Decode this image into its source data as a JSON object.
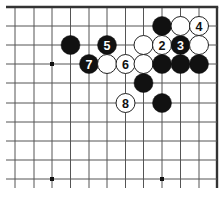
{
  "diagram": {
    "type": "go-board",
    "corner": "top-right",
    "grid": {
      "x_lines": [
        15,
        34,
        52,
        70.5,
        89,
        107,
        125.5,
        143.5,
        162,
        180.5,
        199,
        217
      ],
      "y_lines": [
        7,
        26,
        45,
        64,
        83,
        103,
        122,
        141,
        160,
        179
      ],
      "line_extent": {
        "x_min": 6,
        "x_max": 217,
        "y_min": 7,
        "y_max": 188
      },
      "edges": {
        "top": true,
        "right": true
      },
      "line_color": "#555555",
      "edge_color": "#333333"
    },
    "star_points": [
      {
        "col": 2,
        "row": 3
      },
      {
        "col": 2,
        "row": 9
      },
      {
        "col": 8,
        "row": 9
      }
    ],
    "stones": [
      {
        "col": 3,
        "row": 2,
        "color": "black",
        "label": ""
      },
      {
        "col": 5,
        "row": 2,
        "color": "black",
        "label": "5"
      },
      {
        "col": 4,
        "row": 3,
        "color": "black",
        "label": "7"
      },
      {
        "col": 5,
        "row": 3,
        "color": "white",
        "label": ""
      },
      {
        "col": 6,
        "row": 3,
        "color": "white",
        "label": "6"
      },
      {
        "col": 7,
        "row": 2,
        "color": "white",
        "label": ""
      },
      {
        "col": 8,
        "row": 2,
        "color": "white",
        "label": "2"
      },
      {
        "col": 9,
        "row": 2,
        "color": "black",
        "label": "3"
      },
      {
        "col": 10,
        "row": 2,
        "color": "white",
        "label": ""
      },
      {
        "col": 8,
        "row": 1,
        "color": "black",
        "label": ""
      },
      {
        "col": 9,
        "row": 1,
        "color": "white",
        "label": ""
      },
      {
        "col": 10,
        "row": 1,
        "color": "white",
        "label": "4"
      },
      {
        "col": 7,
        "row": 3,
        "color": "white",
        "label": ""
      },
      {
        "col": 8,
        "row": 3,
        "color": "black",
        "label": ""
      },
      {
        "col": 9,
        "row": 3,
        "color": "black",
        "label": ""
      },
      {
        "col": 10,
        "row": 3,
        "color": "black",
        "label": ""
      },
      {
        "col": 7,
        "row": 4,
        "color": "black",
        "label": ""
      },
      {
        "col": 6,
        "row": 5,
        "color": "white",
        "label": "8"
      },
      {
        "col": 8,
        "row": 5,
        "color": "black",
        "label": ""
      }
    ],
    "colors": {
      "black_stone": "#111111",
      "white_stone": "#ffffff",
      "white_outline": "#222222",
      "black_label": "#ffffff",
      "white_label": "#111111"
    },
    "stone_radius": 9.5
  }
}
